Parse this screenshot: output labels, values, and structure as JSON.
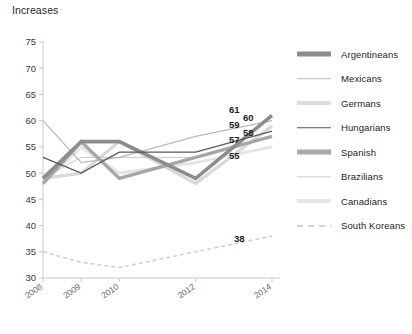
{
  "chart_title": "Increases",
  "chart_data": {
    "type": "line",
    "title": "Increases",
    "xlabel": "",
    "ylabel": "",
    "grid": false,
    "legend_position": "right",
    "x": [
      2008,
      2009,
      2010,
      2012,
      2014
    ],
    "tick_labels_x": [
      "2008",
      "2009",
      "2010",
      "2012",
      "2014"
    ],
    "ylim": [
      30,
      75
    ],
    "yticks": [
      30,
      35,
      40,
      45,
      50,
      55,
      60,
      65,
      70,
      75
    ],
    "tick_labels_y": [
      "30",
      "35",
      "40",
      "45",
      "50",
      "55",
      "60",
      "65",
      "70",
      "75"
    ],
    "series": [
      {
        "name": "Argentineans",
        "color": "#8d8d8d",
        "width": 3.6,
        "dash": "none",
        "values": [
          49,
          56,
          56,
          49,
          61
        ],
        "end_label": "61"
      },
      {
        "name": "Mexicans",
        "color": "#b9b9b9",
        "width": 1.2,
        "dash": "none",
        "values": [
          60,
          52,
          53,
          57,
          60
        ],
        "end_label": "60"
      },
      {
        "name": "Germans",
        "color": "#d9d9d9",
        "width": 3.2,
        "dash": "none",
        "values": [
          49,
          50,
          56,
          48,
          59
        ],
        "end_label": "59"
      },
      {
        "name": "Hungarians",
        "color": "#58585a",
        "width": 1.2,
        "dash": "none",
        "values": [
          53,
          50,
          54,
          54,
          58
        ],
        "end_label": "58"
      },
      {
        "name": "Spanish",
        "color": "#a6a6a6",
        "width": 3.4,
        "dash": "none",
        "values": [
          48,
          56,
          49,
          53,
          57
        ],
        "end_label": "57"
      },
      {
        "name": "Brazilians",
        "color": "#c9c9c9",
        "width": 1.0,
        "dash": "none",
        "values": [
          49,
          53,
          53,
          53,
          57
        ],
        "end_label": ""
      },
      {
        "name": "Canadians",
        "color": "#e4e4e4",
        "width": 3.0,
        "dash": "none",
        "values": [
          48,
          55,
          50,
          52,
          55
        ],
        "end_label": "55"
      },
      {
        "name": "South Koreans",
        "color": "#d0d0d0",
        "width": 1.6,
        "dash": "4 3",
        "values": [
          35,
          33,
          32,
          35,
          38
        ],
        "end_label": "38"
      }
    ]
  },
  "legend": {
    "items": [
      {
        "label": "Argentineans",
        "color": "#8d8d8d",
        "thickness": "5px",
        "dashed": false
      },
      {
        "label": "Mexicans",
        "color": "#bcbcbc",
        "thickness": "1.5px",
        "dashed": false
      },
      {
        "label": "Germans",
        "color": "#dcdcdc",
        "thickness": "4px",
        "dashed": false
      },
      {
        "label": "Hungarians",
        "color": "#58585a",
        "thickness": "1.5px",
        "dashed": false
      },
      {
        "label": "Spanish",
        "color": "#a8a8a8",
        "thickness": "5px",
        "dashed": false
      },
      {
        "label": "Brazilians",
        "color": "#cfcfcf",
        "thickness": "1.5px",
        "dashed": false
      },
      {
        "label": "Canadians",
        "color": "#e6e6e6",
        "thickness": "4px",
        "dashed": false
      },
      {
        "label": "South Koreans",
        "color": "#d2d2d2",
        "thickness": "2px",
        "dashed": true
      }
    ]
  },
  "axis": {
    "color": "#c8c8c8"
  }
}
